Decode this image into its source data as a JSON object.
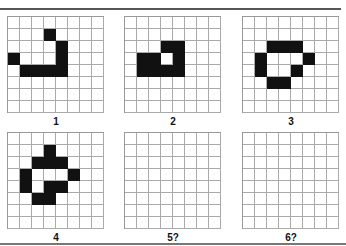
{
  "title": "",
  "grid_size": {
    "cols": 8,
    "rows": 8
  },
  "panels": [
    {
      "label": "1",
      "filled": [
        [
          1,
          3
        ],
        [
          2,
          4
        ],
        [
          3,
          0
        ],
        [
          3,
          4
        ],
        [
          4,
          1
        ],
        [
          4,
          2
        ],
        [
          4,
          3
        ],
        [
          4,
          4
        ]
      ]
    },
    {
      "label": "2",
      "filled": [
        [
          2,
          3
        ],
        [
          2,
          4
        ],
        [
          3,
          1
        ],
        [
          3,
          2
        ],
        [
          3,
          4
        ],
        [
          4,
          1
        ],
        [
          4,
          2
        ],
        [
          4,
          3
        ],
        [
          4,
          4
        ]
      ]
    },
    {
      "label": "3",
      "filled": [
        [
          2,
          2
        ],
        [
          2,
          3
        ],
        [
          2,
          4
        ],
        [
          3,
          1
        ],
        [
          3,
          5
        ],
        [
          4,
          1
        ],
        [
          4,
          4
        ],
        [
          5,
          2
        ],
        [
          5,
          3
        ]
      ]
    },
    {
      "label": "4",
      "filled": [
        [
          1,
          3
        ],
        [
          2,
          2
        ],
        [
          2,
          3
        ],
        [
          2,
          4
        ],
        [
          3,
          1
        ],
        [
          3,
          5
        ],
        [
          4,
          1
        ],
        [
          4,
          3
        ],
        [
          4,
          4
        ],
        [
          5,
          2
        ],
        [
          5,
          3
        ]
      ]
    },
    {
      "label": "5?",
      "filled": []
    },
    {
      "label": "6?",
      "filled": []
    }
  ],
  "colors": {
    "filled": "#111111",
    "empty": "#ffffff",
    "gridline": "#aaaaaa"
  }
}
